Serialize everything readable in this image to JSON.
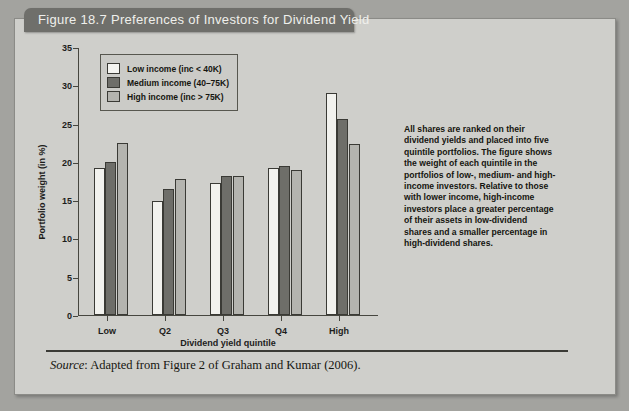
{
  "figure": {
    "title": "Figure 18.7  Preferences of Investors for Dividend Yield",
    "source": "Adapted from Figure 2 of Graham and Kumar (2006).",
    "source_prefix": "Source",
    "note": "All shares are ranked on their dividend yields and placed into five quintile portfolios. The figure shows the weight of each quintile in the portfolios of low-, medium- and high-income investors. Relative to those with lower income, high-income investors place a greater percentage of their assets in low-dividend shares and a smaller percentage in high-dividend shares."
  },
  "chart_data": {
    "type": "bar",
    "title": "",
    "xlabel": "Dividend yield quintile",
    "ylabel": "Portfolio weight (in %)",
    "categories": [
      "Low",
      "Q2",
      "Q3",
      "Q4",
      "High"
    ],
    "series": [
      {
        "name": "Low income (inc < 40K)",
        "color": "#f2f2ee",
        "values": [
          19.2,
          14.9,
          17.3,
          19.2,
          29.0
        ]
      },
      {
        "name": "Medium income (40–75K)",
        "color": "#6e6e69",
        "values": [
          20.0,
          16.4,
          18.2,
          19.4,
          25.6
        ]
      },
      {
        "name": "High income (inc > 75K)",
        "color": "#b4b4af",
        "values": [
          22.5,
          17.8,
          18.2,
          18.9,
          22.3
        ]
      }
    ],
    "ylim": [
      0,
      35
    ],
    "yticks": [
      0,
      5,
      10,
      15,
      20,
      25,
      30,
      35
    ],
    "grid": false,
    "legend_position": "top-left"
  }
}
